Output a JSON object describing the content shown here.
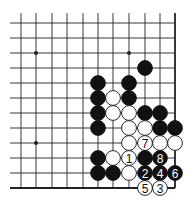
{
  "diagram": {
    "type": "go-board-fragment",
    "grid": {
      "columns": 11,
      "rows": 12,
      "col_x": [
        21,
        36,
        52,
        67,
        83,
        98,
        113,
        129,
        145,
        160,
        175
      ],
      "row_y": [
        23,
        38,
        53,
        68,
        83,
        98,
        113,
        128,
        143,
        158,
        173,
        188
      ],
      "edges": {
        "right": true,
        "bottom": true,
        "left": false,
        "top": false
      }
    },
    "colors": {
      "background": "#ffffff",
      "line": "#222222",
      "black_stone": "#111111",
      "white_stone": "#ffffff",
      "black_label": "#ffffff",
      "white_label": "#111111"
    },
    "star_points": [
      {
        "col": 1,
        "row": 2
      },
      {
        "col": 7,
        "row": 2
      },
      {
        "col": 1,
        "row": 8
      }
    ],
    "stones": [
      {
        "color": "black",
        "col": 8,
        "row": 3,
        "label": ""
      },
      {
        "color": "black",
        "col": 5,
        "row": 4,
        "label": ""
      },
      {
        "color": "black",
        "col": 7,
        "row": 4,
        "label": ""
      },
      {
        "color": "black",
        "col": 5,
        "row": 5,
        "label": ""
      },
      {
        "color": "white",
        "col": 6,
        "row": 5,
        "label": ""
      },
      {
        "color": "black",
        "col": 7,
        "row": 5,
        "label": ""
      },
      {
        "color": "black",
        "col": 5,
        "row": 6,
        "label": ""
      },
      {
        "color": "white",
        "col": 6,
        "row": 6,
        "label": ""
      },
      {
        "color": "white",
        "col": 7,
        "row": 6,
        "label": ""
      },
      {
        "color": "black",
        "col": 8,
        "row": 6,
        "label": ""
      },
      {
        "color": "black",
        "col": 9,
        "row": 6,
        "label": ""
      },
      {
        "color": "black",
        "col": 5,
        "row": 7,
        "label": ""
      },
      {
        "color": "white",
        "col": 7,
        "row": 7,
        "label": ""
      },
      {
        "color": "white",
        "col": 8,
        "row": 7,
        "label": ""
      },
      {
        "color": "black",
        "col": 9,
        "row": 7,
        "label": ""
      },
      {
        "color": "black",
        "col": 10,
        "row": 7,
        "label": ""
      },
      {
        "color": "white",
        "col": 7,
        "row": 8,
        "label": ""
      },
      {
        "color": "white",
        "col": 8,
        "row": 8,
        "label": "7"
      },
      {
        "color": "white",
        "col": 9,
        "row": 8,
        "label": ""
      },
      {
        "color": "white",
        "col": 10,
        "row": 8,
        "label": ""
      },
      {
        "color": "black",
        "col": 5,
        "row": 9,
        "label": ""
      },
      {
        "color": "white",
        "col": 6,
        "row": 9,
        "label": ""
      },
      {
        "color": "white",
        "col": 7,
        "row": 9,
        "label": "1"
      },
      {
        "color": "black",
        "col": 8,
        "row": 9,
        "label": ""
      },
      {
        "color": "black",
        "col": 9,
        "row": 9,
        "label": "8"
      },
      {
        "color": "black",
        "col": 5,
        "row": 10,
        "label": ""
      },
      {
        "color": "black",
        "col": 6,
        "row": 10,
        "label": ""
      },
      {
        "color": "white",
        "col": 7,
        "row": 10,
        "label": ""
      },
      {
        "color": "black",
        "col": 8,
        "row": 10,
        "label": "2"
      },
      {
        "color": "black",
        "col": 9,
        "row": 10,
        "label": "4"
      },
      {
        "color": "black",
        "col": 10,
        "row": 10,
        "label": "6"
      },
      {
        "color": "white",
        "col": 8,
        "row": 11,
        "label": "5"
      },
      {
        "color": "white",
        "col": 9,
        "row": 11,
        "label": "3"
      }
    ]
  }
}
